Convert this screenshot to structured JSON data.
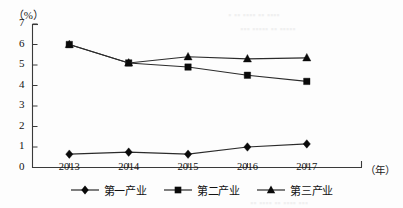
{
  "chart_data": {
    "type": "line",
    "title": "",
    "subtitle": "",
    "xlabel": "（年）",
    "ylabel": "（%）",
    "categories": [
      "2013",
      "2014",
      "2015",
      "2016",
      "2017"
    ],
    "ylim": [
      0,
      7
    ],
    "yticks": [
      "0",
      "1",
      "2",
      "3",
      "4",
      "5",
      "6",
      "7"
    ],
    "grid": false,
    "legend_position": "bottom-center",
    "series": [
      {
        "name": "第一产业",
        "marker": "diamond",
        "values": [
          0.65,
          0.75,
          0.65,
          1.0,
          1.15
        ]
      },
      {
        "name": "第二产业",
        "marker": "square",
        "values": [
          6.0,
          5.1,
          4.9,
          4.5,
          4.2
        ]
      },
      {
        "name": "第三产业",
        "marker": "triangle",
        "values": [
          6.0,
          5.1,
          5.4,
          5.3,
          5.35
        ]
      }
    ],
    "colors": {
      "line": "#2b2b2b",
      "marker": "#0a0a0a",
      "axis": "#3a3a3a",
      "text": "#141414"
    }
  },
  "legend": {
    "items": [
      {
        "label": "第一产业",
        "marker": "diamond"
      },
      {
        "label": "第二产业",
        "marker": "square"
      },
      {
        "label": "第三产业",
        "marker": "triangle"
      }
    ]
  },
  "axes": {
    "y_unit": "（%）",
    "x_unit": "（年）"
  }
}
